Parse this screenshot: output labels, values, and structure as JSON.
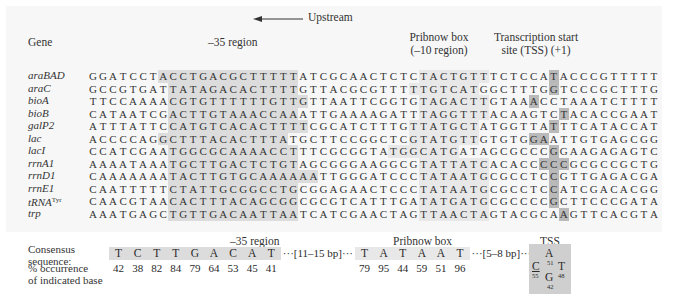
{
  "header": {
    "upstream_label": "Upstream",
    "gene_col_label": "Gene",
    "region35_label": "–35 region",
    "pribnow_label_line1": "Pribnow box",
    "pribnow_label_line2": "(–10 region)",
    "tss_label_line1": "Transcription start",
    "tss_label_line2": "site (TSS)  (+1)"
  },
  "genes": [
    {
      "name": "araBAD",
      "sup": "",
      "seq": "GGATCCTACCTGACGCTTTTTATCGCAACTCTCTACTGTTTCTCCATACCCGTTTTT",
      "r35": [
        7,
        20
      ],
      "r10": [
        33,
        39
      ],
      "tss": [
        46
      ]
    },
    {
      "name": "araC",
      "sup": "",
      "seq": "GCCGTGATTATAGACACTTTTGTTACGCGTTTTTGTCATGGCTTTGGTCCCGCTTTG",
      "r35": [
        8,
        20
      ],
      "r10": [
        32,
        38
      ],
      "tss": [
        46
      ]
    },
    {
      "name": "bioA",
      "sup": "",
      "seq": "TTCCAAAACGTGTTTTTTGTTGTTAATTCGGTGTAGACTTGTAAACCTAAATCTTTT",
      "r35": [
        8,
        21
      ],
      "r10": [
        33,
        39
      ],
      "tss": [
        44
      ]
    },
    {
      "name": "bioB",
      "sup": "",
      "seq": "CATAATCGACTTGTAAACCAAATTGAAAAGATTTAGGTTTACAAGTCTACACCGAAT",
      "r35": [
        8,
        20
      ],
      "r10": [
        33,
        39
      ],
      "tss": [
        47
      ]
    },
    {
      "name": "galP2",
      "sup": "",
      "seq": "ATTTATTCCATGTCACACTTTTCGCATCTTTGTTATGCTATGGTTATTTCATACCAT",
      "r35": [
        8,
        21
      ],
      "r10": [
        32,
        38
      ],
      "tss": [
        46
      ]
    },
    {
      "name": "lac",
      "sup": "",
      "seq": "ACCCCAGGCTTTACACTTTATGCTTCCGGCTCGTATGTTGTGTGGAATTGTGAGCGG",
      "r35": [
        7,
        19
      ],
      "r10": [
        32,
        38
      ],
      "tss": [
        44,
        45
      ]
    },
    {
      "name": "lacI",
      "sup": "",
      "seq": "CCATCGAATGGCGCAAAACCTTTCGCGGTATGGCATGATAGCGCCCGGAAGAGAGTC",
      "r35": [
        8,
        20
      ],
      "r10": [
        30,
        36
      ],
      "tss": [
        46
      ]
    },
    {
      "name": "rrnA1",
      "sup": "",
      "seq": "AAAATAAATGCTTGACTCTGTAGCGGGAAGGCGTATTATCACACCCCCGCGCCGCTG",
      "r35": [
        8,
        20
      ],
      "r10": [
        33,
        39
      ],
      "tss": [
        45,
        46,
        47
      ]
    },
    {
      "name": "rrnD1",
      "sup": "",
      "seq": "CAAAAAAATACTTGTGCAAAAAATTGGGATCCCTATAATGCGCCTCCGTTGAGACGA",
      "r35": [
        8,
        22
      ],
      "r10": [
        33,
        39
      ],
      "tss": [
        46
      ]
    },
    {
      "name": "rrnE1",
      "sup": "",
      "seq": "CAATTTTTCTATTGCGGCCTGCGGAGAACTCCCTATAATGCGCCTCCATCGACACGG",
      "r35": [
        8,
        20
      ],
      "r10": [
        33,
        39
      ],
      "tss": [
        46
      ]
    },
    {
      "name": "tRNA",
      "sup": "Tyr",
      "seq": "CAACGTAACACTTTACAGCGGCGCGTCATTTGATATGATGCGCCCCGCTTCCCGATA",
      "r35": [
        8,
        20
      ],
      "r10": [
        33,
        39
      ],
      "tss": [
        46
      ]
    },
    {
      "name": "trp",
      "sup": "",
      "seq": "AAATGAGCTGTTGACAATTAATCATCGAACTAGTTAACTAGTACGCAAGTTCACGTA",
      "r35": [
        8,
        20
      ],
      "r10": [
        33,
        39
      ],
      "tss": [
        47
      ]
    }
  ],
  "consensus": {
    "label_line1": "Consensus",
    "label_line2": "sequence:",
    "pct_label_line1": "% occurrence",
    "pct_label_line2": "of indicated base",
    "region35_label": "–35 region",
    "pribnow_label": "Pribnow box",
    "tss_label": "TSS",
    "region35_bases": [
      "T",
      "C",
      "T",
      "T",
      "G",
      "A",
      "C",
      "A",
      "T"
    ],
    "region35_pct": [
      "42",
      "38",
      "82",
      "84",
      "79",
      "64",
      "53",
      "45",
      "41"
    ],
    "spacer1": "···[11–15 bp]···",
    "pribnow_bases": [
      "T",
      "A",
      "T",
      "A",
      "A",
      "T"
    ],
    "pribnow_pct": [
      "79",
      "95",
      "44",
      "59",
      "51",
      "96"
    ],
    "spacer2": "···[5–8 bp]···",
    "tss_bases": [
      {
        "base": "A",
        "pct": "51"
      },
      {
        "base": "C",
        "pct": "55"
      },
      {
        "base": "T",
        "pct": "48"
      },
      {
        "base": "G",
        "pct": "42"
      }
    ]
  }
}
